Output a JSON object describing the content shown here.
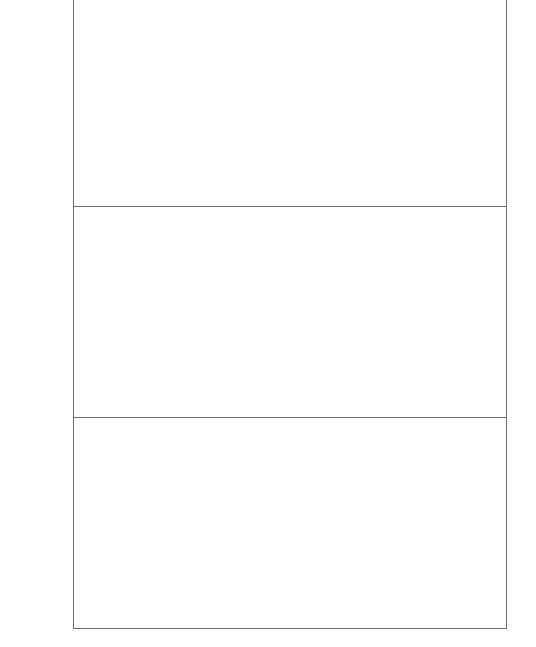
{
  "document": {
    "panels": [
      {
        "id": "panel-1",
        "text": ""
      },
      {
        "id": "panel-2",
        "text": ""
      },
      {
        "id": "panel-3",
        "text": ""
      }
    ],
    "colors": {
      "border": "#6e6e6e",
      "background": "#ffffff"
    }
  }
}
